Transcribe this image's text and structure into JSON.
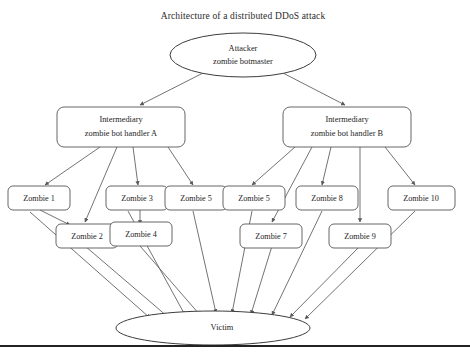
{
  "figure": {
    "title": "Architecture of a distributed DDoS attack",
    "background_color": "#ffffff",
    "node_fill": "#ffffff",
    "node_stroke": "#555555",
    "edge_color": "#5a5a5a",
    "text_color": "#1e1e1e",
    "rule_color": "#222222"
  },
  "nodes": {
    "attacker": {
      "shape": "ellipse",
      "line1": "Attacker",
      "line2": "zombie botmaster"
    },
    "handler_a": {
      "shape": "rounded-rect",
      "line1": "Intermediary",
      "line2": "zombie bot handler A"
    },
    "handler_b": {
      "shape": "rounded-rect",
      "line1": "Intermediary",
      "line2": "zombie bot handler B"
    },
    "victim": {
      "shape": "ellipse",
      "label": "Victim"
    }
  },
  "zombies": {
    "top_row": [
      {
        "id": "zombie-1",
        "label": "Zombie 1"
      },
      {
        "id": "zombie-3",
        "label": "Zombie 3"
      },
      {
        "id": "zombie-5a",
        "label": "Zombie 5"
      },
      {
        "id": "zombie-5b",
        "label": "Zombie 5"
      },
      {
        "id": "zombie-8",
        "label": "Zombie 8"
      },
      {
        "id": "zombie-10",
        "label": "Zombie 10"
      }
    ],
    "bottom_row": [
      {
        "id": "zombie-2",
        "label": "Zombie 2"
      },
      {
        "id": "zombie-4",
        "label": "Zombie 4"
      },
      {
        "id": "zombie-7",
        "label": "Zombie 7"
      },
      {
        "id": "zombie-9",
        "label": "Zombie 9"
      }
    ]
  }
}
